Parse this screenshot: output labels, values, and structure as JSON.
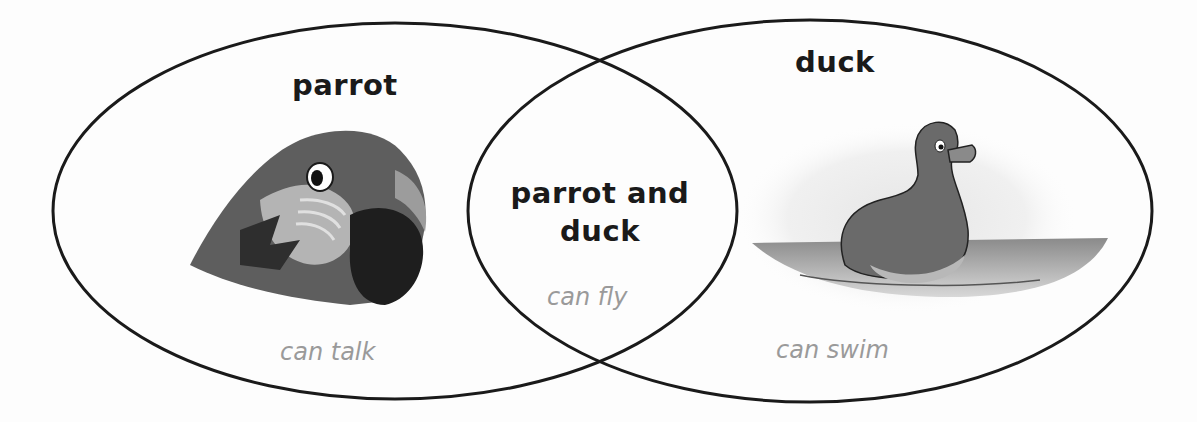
{
  "diagram": {
    "type": "venn",
    "sets": [
      {
        "name": "parrot",
        "label": "parrot",
        "trait": "can talk",
        "image": "parrot-head-illustration"
      },
      {
        "name": "duck",
        "label": "duck",
        "trait": "can swim",
        "image": "duck-swimming-illustration"
      }
    ],
    "intersection": {
      "label_line1": "parrot and",
      "label_line2": "duck",
      "trait": "can fly"
    },
    "colors": {
      "outline": "#1a1a1a",
      "label": "#1a1a1a",
      "trait_text": "#9a9a9a",
      "background": "#ffffff"
    }
  }
}
